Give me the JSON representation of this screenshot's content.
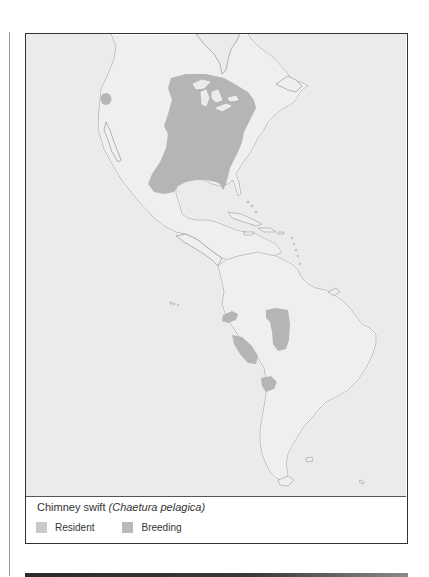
{
  "figure": {
    "caption": {
      "common_name": "Chimney swift",
      "scientific_name": "(Chaetura pelagica)"
    },
    "legend": {
      "items": [
        {
          "label": "Resident",
          "color": "#c9c9c9"
        },
        {
          "label": "Breeding",
          "color": "#bababa"
        }
      ]
    },
    "map": {
      "region": "The Americas",
      "colors": {
        "sea": "#ebebeb",
        "land": "#efefef",
        "coastline": "#ffffff",
        "coastline_shadow": "#8c8c8c",
        "breeding_range": "#b5b5b5",
        "frame": "#333333"
      }
    }
  }
}
